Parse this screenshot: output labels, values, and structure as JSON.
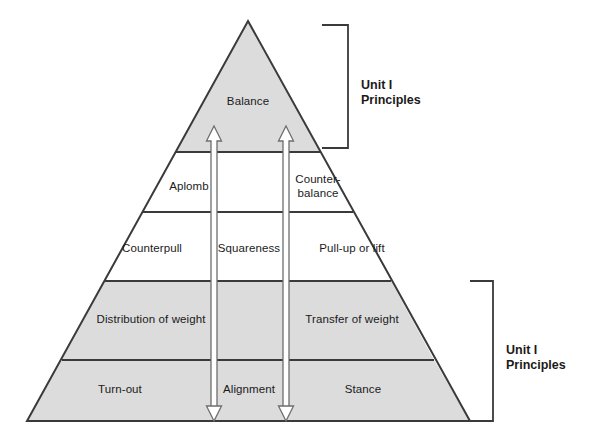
{
  "diagram": {
    "type": "layered-pyramid",
    "colors": {
      "fill_shaded": "#dcdcdc",
      "fill_plain": "#ffffff",
      "outline": "#3a3a3a",
      "divider": "#4a4a4a",
      "text": "#1a1a1a",
      "arrow_stroke": "#6e6e6e",
      "arrow_fill": "#ffffff",
      "bracket": "#3a3a3a"
    },
    "tiers": [
      {
        "id": "tier-apex",
        "shaded": true,
        "cells": [
          {
            "id": "cell-balance",
            "label": "Balance",
            "x": 248,
            "y": 101
          }
        ]
      },
      {
        "id": "tier-two",
        "shaded": false,
        "cells": [
          {
            "id": "cell-aplomb",
            "label": "Aplomb",
            "x": 189,
            "y": 186
          },
          {
            "id": "cell-blank-middle",
            "label": "",
            "x": 249,
            "y": 186
          },
          {
            "id": "cell-counterbalance",
            "label": "Counter-\nbalance",
            "x": 318,
            "y": 186
          }
        ]
      },
      {
        "id": "tier-three",
        "shaded": false,
        "cells": [
          {
            "id": "cell-counterpull",
            "label": "Counterpull",
            "x": 152,
            "y": 248
          },
          {
            "id": "cell-squareness",
            "label": "Squareness",
            "x": 249,
            "y": 248
          },
          {
            "id": "cell-pullup-or-lift",
            "label": "Pull-up or lift",
            "x": 352,
            "y": 248
          }
        ]
      },
      {
        "id": "tier-four",
        "shaded": true,
        "cells": [
          {
            "id": "cell-distribution-of-weight",
            "label": "Distribution of weight",
            "x": 151,
            "y": 319
          },
          {
            "id": "cell-transfer-of-weight",
            "label": "Transfer of weight",
            "x": 352,
            "y": 319
          }
        ]
      },
      {
        "id": "tier-base",
        "shaded": true,
        "cells": [
          {
            "id": "cell-turn-out",
            "label": "Turn-out",
            "x": 120,
            "y": 389
          },
          {
            "id": "cell-alignment",
            "label": "Alignment",
            "x": 249,
            "y": 389
          },
          {
            "id": "cell-stance",
            "label": "Stance",
            "x": 363,
            "y": 389
          }
        ]
      }
    ],
    "brackets": [
      {
        "id": "bracket-top",
        "line1": "Unit I",
        "line2": "Principles",
        "label_x": 361,
        "label_y": 78
      },
      {
        "id": "bracket-bottom",
        "line1": "Unit I",
        "line2": "Principles",
        "label_x": 506,
        "label_y": 343
      }
    ],
    "arrows": [
      {
        "id": "arrow-left",
        "x": 214
      },
      {
        "id": "arrow-right",
        "x": 286
      }
    ]
  }
}
